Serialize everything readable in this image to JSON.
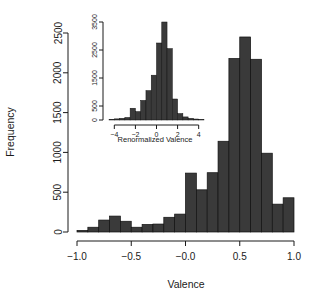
{
  "chart_data": [
    {
      "id": "main",
      "type": "bar",
      "title": "",
      "xlabel": "Valence",
      "ylabel": "Frequency",
      "xlim": [
        -1.0,
        1.0
      ],
      "ylim": [
        0,
        2600
      ],
      "grid": false,
      "legend": "none",
      "bar_color": "#3a3a3a",
      "xticks": [
        -1.0,
        -0.5,
        -0.0,
        0.5,
        1.0
      ],
      "xticklabels": [
        "-1.0",
        "-0.5",
        "-0.0",
        "0.5",
        "1.0"
      ],
      "yticks": [
        0,
        500,
        1000,
        1500,
        2000,
        2500
      ],
      "yticklabels": [
        "0",
        "500",
        "1000",
        "1500",
        "2000",
        "2500"
      ],
      "bin_edges": [
        -1.0,
        -0.9,
        -0.8,
        -0.7,
        -0.6,
        -0.5,
        -0.4,
        -0.3,
        -0.2,
        -0.1,
        0.0,
        0.1,
        0.2,
        0.3,
        0.4,
        0.5,
        0.6,
        0.7,
        0.8,
        0.9,
        1.0
      ],
      "values": [
        20,
        60,
        150,
        200,
        135,
        60,
        95,
        100,
        185,
        225,
        740,
        530,
        745,
        1140,
        2180,
        2450,
        2170,
        990,
        350,
        430
      ]
    },
    {
      "id": "inset",
      "type": "bar",
      "title": "",
      "xlabel": "Renormalized Valence",
      "ylabel": "",
      "xlim": [
        -4.6,
        4.6
      ],
      "ylim": [
        0,
        3650
      ],
      "grid": false,
      "legend": "none",
      "bar_color": "#3a3a3a",
      "xticks": [
        -4,
        -2,
        0,
        2,
        4
      ],
      "xticklabels": [
        "-4",
        "-2",
        "0",
        "2",
        "4"
      ],
      "yticks": [
        0,
        500,
        1500,
        2500,
        3500
      ],
      "yticklabels": [
        "0",
        "500",
        "1500",
        "2500",
        "3500"
      ],
      "bin_edges": [
        -4.5,
        -4.0,
        -3.5,
        -3.0,
        -2.5,
        -2.0,
        -1.5,
        -1.0,
        -0.5,
        0.0,
        0.5,
        1.0,
        1.5,
        2.0,
        2.5,
        3.0,
        3.5,
        4.0,
        4.5
      ],
      "values": [
        25,
        40,
        60,
        90,
        420,
        300,
        700,
        1050,
        1600,
        2750,
        3500,
        2550,
        750,
        230,
        110,
        60,
        35,
        20
      ]
    }
  ],
  "figure": {
    "main_xlabel": "Valence",
    "main_ylabel": "Frequency",
    "inset_xlabel": "Renormalized Valence"
  }
}
